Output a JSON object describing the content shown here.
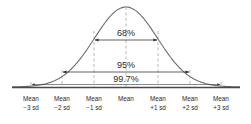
{
  "diagram": {
    "type": "normal-distribution-empirical-rule",
    "colors": {
      "curve": "#6f6f6f",
      "axis": "#4a4a4a",
      "dashed": "#a6a6a6",
      "arrow": "#3a3a3a",
      "text": "#2a2a2a"
    },
    "intervals": [
      {
        "label": "68%",
        "from": "Mean -1 sd",
        "to": "Mean +1 sd"
      },
      {
        "label": "95%",
        "from": "Mean -2 sd",
        "to": "Mean +2 sd"
      },
      {
        "label": "99.7%",
        "from": "Mean -3 sd",
        "to": "Mean +3 sd"
      }
    ],
    "ticks": [
      {
        "line1": "Mean",
        "line2": "−3 sd"
      },
      {
        "line1": "Mean",
        "line2": "−2 sd"
      },
      {
        "line1": "Mean",
        "line2": "−1 sd"
      },
      {
        "line1": "Mean",
        "line2": ""
      },
      {
        "line1": "Mean",
        "line2": "+1 sd"
      },
      {
        "line1": "Mean",
        "line2": "+2 sd"
      },
      {
        "line1": "Mean",
        "line2": "+3 sd"
      }
    ]
  }
}
